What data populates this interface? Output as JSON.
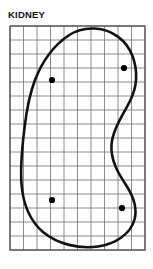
{
  "figure": {
    "title": "KIDNEY",
    "kind": "anatomical-outline-on-grid",
    "background_color": "#ffffff",
    "outline_color": "#111111",
    "grid_color": "#6e6e6e",
    "border_color": "#4a4a4a",
    "marker_color": "#000000"
  },
  "grid": {
    "label": "measurement-grid",
    "origin_x": 10,
    "origin_y": 26,
    "columns": 10,
    "rows": 16,
    "cell_width": 13.5,
    "cell_height": 14.0,
    "width": 135,
    "height": 224,
    "line_width": 0.8,
    "border_width": 1.2,
    "show_grid": true
  },
  "shape": {
    "label": "kidney-outline",
    "stroke_width": 2.6,
    "closed": true,
    "path": "M 95.0 28.5 C 112.0 29.5 126.5 40.0 132.5 56.0 C 138.0 71.0 137.0 87.0 130.0 101.0 C 122.5 116.0 112.5 130.0 111.5 145.0 C 110.5 160.0 118.0 173.0 126.0 185.0 C 133.5 196.5 137.5 208.5 134.5 219.5 C 130.5 234.0 115.5 244.0 98.0 246.5 C 79.0 249.0 58.0 244.5 43.0 232.0 C 29.5 220.5 23.0 203.0 21.5 184.0 C 20.0 164.0 22.5 144.5 24.5 128.0 C 26.5 111.0 29.0 95.5 35.0 80.0 C 42.0 62.0 53.0 46.0 68.5 35.5 C 76.5 30.0 85.5 28.0 95.0 28.5 Z",
    "anchors": {
      "top_peak": [
        95,
        28.5
      ],
      "right_bulge": [
        136,
        73
      ],
      "right_concavity": [
        111.5,
        145
      ],
      "bottom_right": [
        133,
        210
      ],
      "bottom_low": [
        88,
        247
      ],
      "left_bulge": [
        21.5,
        178
      ],
      "upper_left": [
        40,
        68
      ]
    }
  },
  "markers": {
    "label": "sample-points",
    "radius": 3.1,
    "points": [
      {
        "name": "marker-upper-left",
        "x": 52,
        "y": 80
      },
      {
        "name": "marker-upper-right",
        "x": 124,
        "y": 68
      },
      {
        "name": "marker-lower-left",
        "x": 52,
        "y": 200
      },
      {
        "name": "marker-lower-right",
        "x": 122,
        "y": 208
      }
    ]
  }
}
